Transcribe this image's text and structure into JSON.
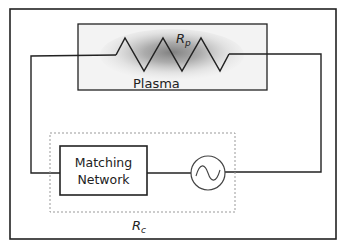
{
  "diagram": {
    "type": "circuit",
    "plasma_label": "Plasma",
    "plasma_resistor": {
      "symbol": "R",
      "subscript": "p"
    },
    "coupling_resistor": {
      "symbol": "R",
      "subscript": "c"
    },
    "matching_network": {
      "line1": "Matching",
      "line2": "Network"
    },
    "source": {
      "icon": "ac-source-icon"
    },
    "colors": {
      "line": "#222222",
      "dashed": "#999999",
      "plasma_glow": "#7a7a7a"
    }
  }
}
